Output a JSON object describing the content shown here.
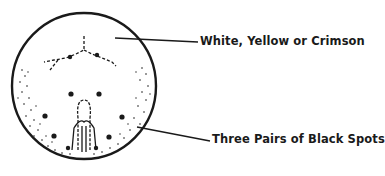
{
  "figure": {
    "labels": [
      {
        "text": "White, Yellow or Crimson"
      },
      {
        "text": "Three Pairs of Black Spots"
      }
    ],
    "colors": {
      "ink": "#1a1a1a",
      "background": "#ffffff"
    }
  }
}
